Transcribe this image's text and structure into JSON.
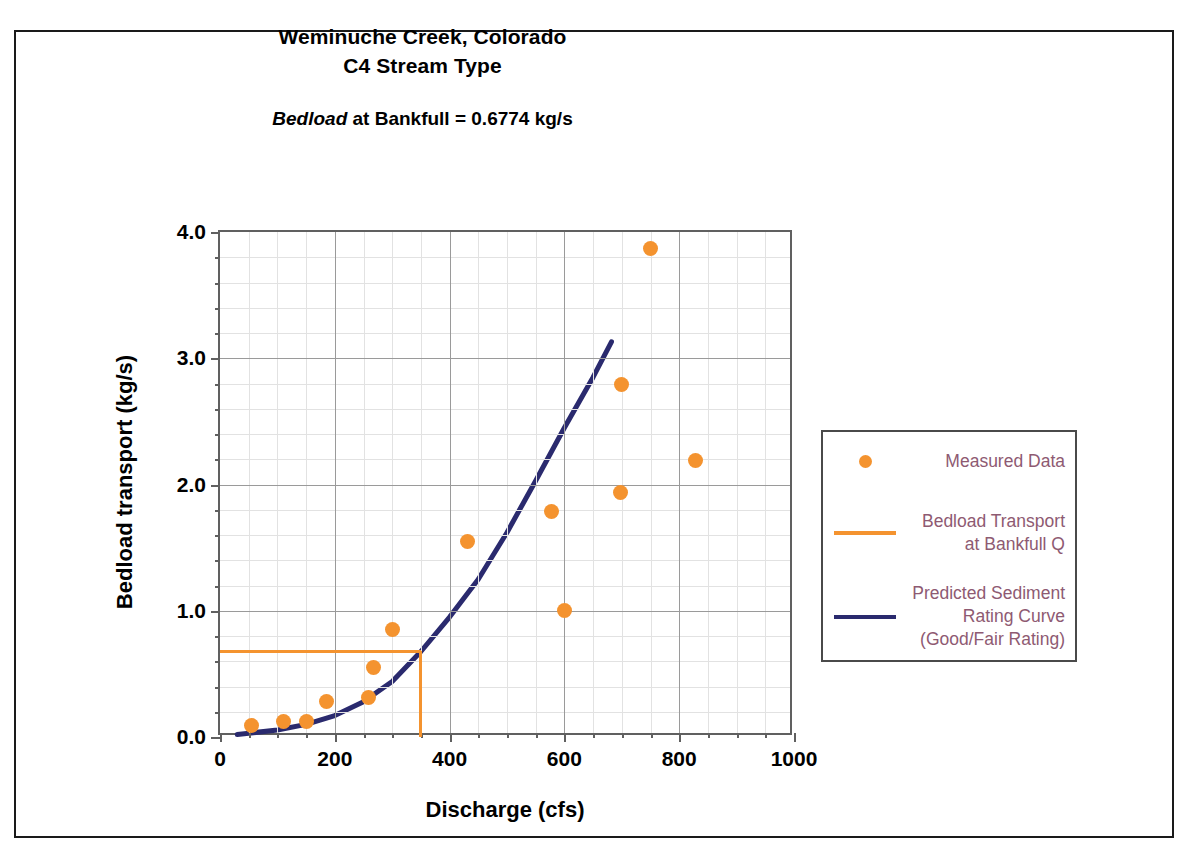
{
  "header": {
    "title_line1": "Weminuche Creek, Colorado",
    "title_line2": "C4 Stream Type",
    "subtitle_italic": "Bedload",
    "subtitle_rest": " at Bankfull = 0.6774 kg/s"
  },
  "legend": {
    "items": [
      {
        "label": "Measured Data",
        "key": "dot",
        "color": "#F4932F"
      },
      {
        "label": "Bedload Transport\nat Bankfull Q",
        "key": "line",
        "color": "#F4932F"
      },
      {
        "label": "Predicted Sediment\nRating Curve\n(Good/Fair Rating)",
        "key": "line",
        "color": "#2A2A6E"
      }
    ],
    "text_color": "#8E5A72"
  },
  "colors": {
    "measured_orange": "#F4932F",
    "bankfull_orange": "#F4932F",
    "rating_curve_navy": "#2A2A6E",
    "axis_gray": "#606060",
    "grid_gray": "#9A9A9A",
    "minor_grid_gray": "#E2E2E2",
    "frame_black": "#1A1A1A",
    "legend_text": "#8E5A72"
  },
  "chart_data": {
    "type": "scatter",
    "title": "Weminuche Creek, Colorado C4 Stream Type",
    "subtitle": "Bedload at Bankfull = 0.6774 kg/s",
    "xlabel": "Discharge (cfs)",
    "ylabel": "Bedload transport (kg/s)",
    "xlim": [
      0,
      1000
    ],
    "ylim": [
      0,
      4.0
    ],
    "xticks": [
      0,
      200,
      400,
      600,
      800,
      1000
    ],
    "yticks": [
      "0.0",
      "1.0",
      "2.0",
      "3.0",
      "4.0"
    ],
    "xtick_labels": [
      "0",
      "200",
      "400",
      "600",
      "800",
      "1000"
    ],
    "ytick_labels": [
      "0.0",
      "1.0",
      "2.0",
      "3.0",
      "4.0"
    ],
    "x_minor_step": 50,
    "y_minor_step": 0.2,
    "grid": true,
    "legend_position": "right-outside",
    "series": [
      {
        "name": "Measured Data",
        "type": "scatter",
        "color": "#F4932F",
        "points": [
          {
            "x": 55,
            "y": 0.09
          },
          {
            "x": 110,
            "y": 0.12
          },
          {
            "x": 150,
            "y": 0.12
          },
          {
            "x": 185,
            "y": 0.28
          },
          {
            "x": 258,
            "y": 0.31
          },
          {
            "x": 268,
            "y": 0.55
          },
          {
            "x": 300,
            "y": 0.85
          },
          {
            "x": 432,
            "y": 1.55
          },
          {
            "x": 578,
            "y": 1.79
          },
          {
            "x": 600,
            "y": 1.0
          },
          {
            "x": 697,
            "y": 1.94
          },
          {
            "x": 700,
            "y": 2.79
          },
          {
            "x": 750,
            "y": 3.87
          },
          {
            "x": 828,
            "y": 2.19
          }
        ]
      },
      {
        "name": "Predicted Sediment Rating Curve (Good/Fair Rating)",
        "type": "line",
        "color": "#2A2A6E",
        "points": [
          {
            "x": 30,
            "y": 0.02
          },
          {
            "x": 100,
            "y": 0.055
          },
          {
            "x": 150,
            "y": 0.1
          },
          {
            "x": 200,
            "y": 0.17
          },
          {
            "x": 250,
            "y": 0.28
          },
          {
            "x": 300,
            "y": 0.44
          },
          {
            "x": 350,
            "y": 0.6774
          },
          {
            "x": 400,
            "y": 0.95
          },
          {
            "x": 450,
            "y": 1.25
          },
          {
            "x": 500,
            "y": 1.62
          },
          {
            "x": 550,
            "y": 2.03
          },
          {
            "x": 600,
            "y": 2.45
          },
          {
            "x": 650,
            "y": 2.85
          },
          {
            "x": 682,
            "y": 3.13
          }
        ]
      },
      {
        "name": "Bedload Transport at Bankfull Q",
        "type": "reference",
        "color": "#F4932F",
        "bankfull_discharge": 350,
        "bankfull_transport": 0.6774
      }
    ]
  }
}
